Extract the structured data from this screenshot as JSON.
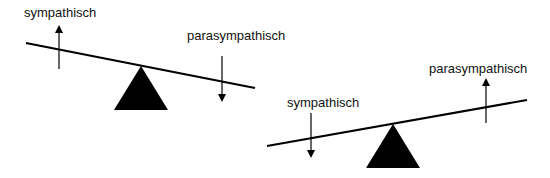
{
  "diagram": {
    "type": "balance-comparison",
    "colors": {
      "stroke": "#000000",
      "fill": "#000000",
      "text": "#111111",
      "background": "#ffffff"
    },
    "balances": [
      {
        "id": "left",
        "state": "sympathisch-dominant",
        "beam": {
          "x1": 26,
          "y1": 43,
          "x2": 255,
          "y2": 88
        },
        "fulcrum": {
          "apex": [
            141,
            66
          ],
          "base_left": [
            114,
            110
          ],
          "base_right": [
            168,
            110
          ]
        },
        "labels": [
          {
            "text": "sympathisch",
            "x": 24,
            "y": 6,
            "arrow": "up",
            "arrow_x": 59,
            "arrow_from": 69,
            "arrow_to": 25
          },
          {
            "text": "parasympathisch",
            "x": 187,
            "y": 29,
            "arrow": "down",
            "arrow_x": 222,
            "arrow_from": 56,
            "arrow_to": 102
          }
        ]
      },
      {
        "id": "right",
        "state": "parasympathisch-dominant",
        "beam": {
          "x1": 267,
          "y1": 146,
          "x2": 527,
          "y2": 100
        },
        "fulcrum": {
          "apex": [
            393,
            124
          ],
          "base_left": [
            366,
            168
          ],
          "base_right": [
            420,
            168
          ]
        },
        "labels": [
          {
            "text": "sympathisch",
            "x": 287,
            "y": 96,
            "arrow": "down",
            "arrow_x": 311,
            "arrow_from": 113,
            "arrow_to": 158
          },
          {
            "text": "parasympathisch",
            "x": 429,
            "y": 62,
            "arrow": "up",
            "arrow_x": 486,
            "arrow_from": 123,
            "arrow_to": 78
          }
        ]
      }
    ]
  }
}
